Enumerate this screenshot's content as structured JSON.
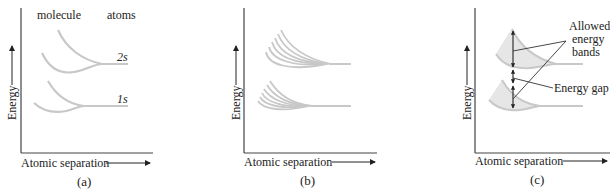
{
  "figure": {
    "panels": [
      {
        "id": "a",
        "caption": "(a)",
        "xlabel": "Atomic separation",
        "ylabel": "Energy",
        "headers": {
          "left": "molecule",
          "right": "atoms"
        },
        "levels": [
          {
            "label": "2s"
          },
          {
            "label": "1s"
          }
        ]
      },
      {
        "id": "b",
        "caption": "(b)",
        "xlabel": "Atomic separation",
        "ylabel": "Energy",
        "levels": [
          {
            "fan_curves": 6
          },
          {
            "fan_curves": 6
          }
        ]
      },
      {
        "id": "c",
        "caption": "(c)",
        "xlabel": "Atomic separation",
        "ylabel": "Energy",
        "annotations": {
          "bands_line1": "Allowed",
          "bands_line2": "energy",
          "bands_line3": "bands",
          "gap": "Energy gap"
        }
      }
    ],
    "colors": {
      "curve": "#c8c8c8",
      "band_fill": "#e6e6e6",
      "axis": "#333333",
      "annotation_line": "#333333"
    }
  }
}
